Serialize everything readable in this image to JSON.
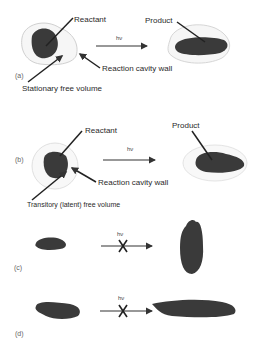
{
  "figure": {
    "panels": [
      {
        "id": "a",
        "label": "(a)",
        "reactant_label": "Reactant",
        "product_label": "Product",
        "arrow_label": "hν",
        "wall_label": "Reaction cavity wall",
        "free_volume_label": "Stationary free volume",
        "reaction_allowed": true
      },
      {
        "id": "b",
        "label": "(b)",
        "reactant_label": "Reactant",
        "product_label": "Product",
        "arrow_label": "hν",
        "wall_label": "Reaction cavity wall",
        "free_volume_label": "Transitory (latent) free volume",
        "reaction_allowed": true
      },
      {
        "id": "c",
        "label": "(c)",
        "arrow_label": "hν",
        "reaction_allowed": false
      },
      {
        "id": "d",
        "label": "(d)",
        "arrow_label": "hν",
        "reaction_allowed": false
      }
    ],
    "colors": {
      "blob": "#3a3a3a",
      "cavity": "#d8d8d8",
      "arrow": "#333333",
      "background": "#ffffff"
    }
  }
}
